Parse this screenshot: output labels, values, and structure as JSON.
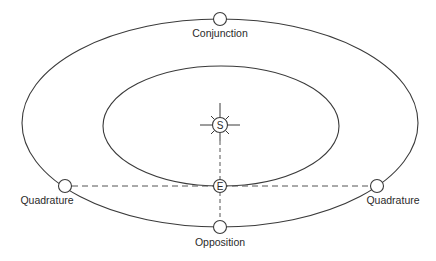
{
  "diagram": {
    "colors": {
      "line": "#3a3a3a",
      "dash": "#555555",
      "text": "#2a2a2a",
      "background": "#ffffff"
    },
    "orbits": [
      {
        "name": "outer-planet-orbit",
        "cx": 220,
        "cy": 123,
        "rx": 198,
        "ry": 104
      },
      {
        "name": "earth-orbit",
        "cx": 221,
        "cy": 126,
        "rx": 118,
        "ry": 60
      }
    ],
    "bodies": {
      "sun": {
        "symbol": "S",
        "x": 220,
        "y": 125
      },
      "earth": {
        "symbol": "E",
        "x": 220,
        "y": 186
      }
    },
    "positions": [
      {
        "id": "conjunction",
        "label": "Conjunction",
        "x": 220,
        "y": 19
      },
      {
        "id": "opposition",
        "label": "Opposition",
        "x": 220,
        "y": 227
      },
      {
        "id": "quadrature-left",
        "label": "Quadrature",
        "x": 65,
        "y": 186
      },
      {
        "id": "quadrature-right",
        "label": "Quadrature",
        "x": 377,
        "y": 186
      }
    ],
    "labels": {
      "conjunction": "Conjunction",
      "opposition": "Opposition",
      "quadrature_left": "Quadrature",
      "quadrature_right": "Quadrature",
      "sun": "S",
      "earth": "E"
    }
  }
}
